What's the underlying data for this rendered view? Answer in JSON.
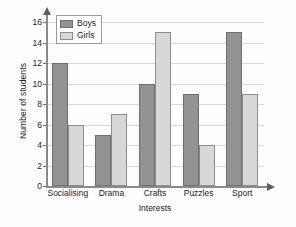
{
  "chart_data": {
    "type": "bar",
    "title": "",
    "xlabel": "Interests",
    "ylabel": "Number of students",
    "categories": [
      "Socialising",
      "Drama",
      "Crafts",
      "Puzzles",
      "Sport"
    ],
    "series": [
      {
        "name": "Boys",
        "values": [
          12,
          5,
          10,
          9,
          15
        ],
        "color": "#939393"
      },
      {
        "name": "Girls",
        "values": [
          6,
          7,
          15,
          4,
          9
        ],
        "color": "#d8d8d8"
      }
    ],
    "ylim": [
      0,
      16
    ],
    "ytick_step": 2,
    "yticks": [
      0,
      2,
      4,
      6,
      8,
      10,
      12,
      14,
      16
    ],
    "ytick_labels": [
      "0",
      "2",
      "4",
      "6",
      "8",
      "10",
      "12",
      "14",
      "16"
    ],
    "grid": true,
    "grid_axis": "y",
    "legend_position": "top-left",
    "axis_arrows": true
  },
  "legend": {
    "entries": [
      {
        "label": "Boys"
      },
      {
        "label": "Girls"
      }
    ]
  },
  "axes": {
    "y_title": "Number of students",
    "x_title": "Interests"
  },
  "colors": {
    "boys": "#939393",
    "girls": "#d8d8d8",
    "gridline": "#d9d9d9",
    "axis": "#8a8a8a",
    "background": "#fdfdfd"
  }
}
